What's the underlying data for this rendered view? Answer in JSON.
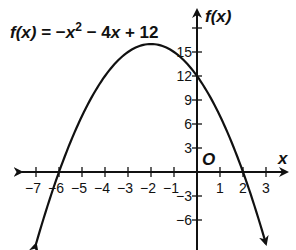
{
  "chart_data": {
    "type": "line",
    "title": "",
    "equation": {
      "lhs": "f(x)",
      "rhs": "= −x² − 4x + 12",
      "parts": [
        "f(x)",
        " = −",
        "x",
        "2",
        " − 4",
        "x",
        " + 12"
      ]
    },
    "function": {
      "a": -1,
      "b": -4,
      "c": 12
    },
    "xlabel": "x",
    "ylabel": "f(x)",
    "origin_label": "O",
    "xlim": [
      -7.8,
      4
    ],
    "ylim": [
      -9.5,
      20.5
    ],
    "x_ticks": [
      -7,
      -6,
      -5,
      -4,
      -3,
      -2,
      -1,
      1,
      2,
      3
    ],
    "x_tick_labels": [
      "−7",
      "−6",
      "−5",
      "−4",
      "−3",
      "−2",
      "−1",
      "1",
      "2",
      "3"
    ],
    "y_ticks": [
      -6,
      -3,
      3,
      6,
      9,
      12,
      15,
      18
    ],
    "y_tick_labels": [
      "−6",
      "−3",
      "3",
      "6",
      "9",
      "12",
      "15",
      ""
    ],
    "curve_domain": [
      -7,
      3
    ],
    "vertex": [
      -2,
      16
    ],
    "x_intercepts": [
      -6,
      2
    ],
    "y_intercept": 12,
    "grid": false,
    "line_color": "#111111"
  }
}
